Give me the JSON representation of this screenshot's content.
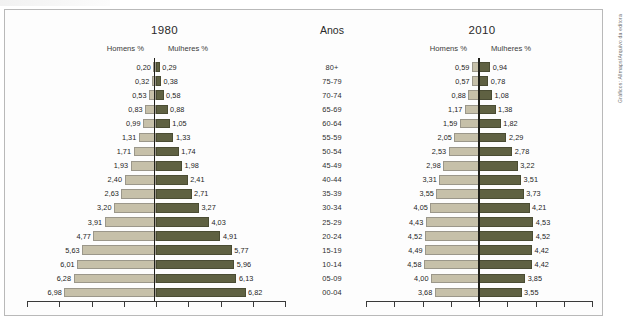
{
  "credit": "Gráficos: Allmaps/Arquivo da editora",
  "years_header": "Anos",
  "age_groups": [
    "80+",
    "75-79",
    "70-74",
    "65-69",
    "60-64",
    "55-59",
    "50-54",
    "45-49",
    "40-44",
    "35-39",
    "30-34",
    "25-29",
    "20-24",
    "15-19",
    "10-14",
    "05-09",
    "00-04"
  ],
  "panels": {
    "left": {
      "title": "1980",
      "men_label": "Homens %",
      "women_label": "Mulheres %"
    },
    "right": {
      "title": "2010",
      "men_label": "Homens %",
      "women_label": "Mulheres %"
    }
  },
  "colors": {
    "men_bar": "#c6c0a9",
    "women_bar": "#5f6142",
    "spine": "#20201a",
    "frame": "#b9b9b9"
  },
  "chart_data": [
    {
      "type": "bar",
      "title": "1980",
      "subtype": "population-pyramid",
      "categories": [
        "80+",
        "75-79",
        "70-74",
        "65-69",
        "60-64",
        "55-59",
        "50-54",
        "45-49",
        "40-44",
        "35-39",
        "30-34",
        "25-29",
        "20-24",
        "15-19",
        "10-14",
        "05-09",
        "00-04"
      ],
      "xlabel": "",
      "ylabel": "Anos",
      "xlim": [
        0,
        8
      ],
      "grid": false,
      "legend": [
        "Homens %",
        "Mulheres %"
      ],
      "series": [
        {
          "name": "Homens %",
          "values": [
            0.2,
            0.32,
            0.53,
            0.83,
            0.99,
            1.31,
            1.71,
            1.93,
            2.4,
            2.63,
            3.2,
            3.91,
            4.77,
            5.63,
            6.01,
            6.28,
            6.98
          ]
        },
        {
          "name": "Mulheres %",
          "values": [
            0.29,
            0.38,
            0.58,
            0.88,
            1.05,
            1.33,
            1.74,
            1.98,
            2.41,
            2.71,
            3.27,
            4.03,
            4.91,
            5.77,
            5.96,
            6.13,
            6.82
          ]
        }
      ],
      "labels": {
        "Homens %": [
          "0,20",
          "0,32",
          "0,53",
          "0,83",
          "0,99",
          "1,31",
          "1,71",
          "1,93",
          "2,40",
          "2,63",
          "3,20",
          "3,91",
          "4,77",
          "5,63",
          "6,01",
          "6,28",
          "6,98"
        ],
        "Mulheres %": [
          "0,29",
          "0,38",
          "0,58",
          "0,88",
          "1,05",
          "1,33",
          "1,74",
          "1,98",
          "2,41",
          "2,71",
          "3,27",
          "4,03",
          "4,91",
          "5,77",
          "5,96",
          "6,13",
          "6,82"
        ]
      }
    },
    {
      "type": "bar",
      "title": "2010",
      "subtype": "population-pyramid",
      "categories": [
        "80+",
        "75-79",
        "70-74",
        "65-69",
        "60-64",
        "55-59",
        "50-54",
        "45-49",
        "40-44",
        "35-39",
        "30-34",
        "25-29",
        "20-24",
        "15-19",
        "10-14",
        "05-09",
        "00-04"
      ],
      "xlabel": "",
      "ylabel": "Anos",
      "xlim": [
        0,
        8
      ],
      "grid": false,
      "legend": [
        "Homens %",
        "Mulheres %"
      ],
      "series": [
        {
          "name": "Homens %",
          "values": [
            0.59,
            0.57,
            0.88,
            1.17,
            1.59,
            2.05,
            2.53,
            2.98,
            3.31,
            3.55,
            4.05,
            4.43,
            4.52,
            4.49,
            4.58,
            4.0,
            3.68
          ]
        },
        {
          "name": "Mulheres %",
          "values": [
            0.94,
            0.78,
            1.08,
            1.38,
            1.82,
            2.29,
            2.78,
            3.22,
            3.51,
            3.73,
            4.21,
            4.53,
            4.52,
            4.42,
            4.42,
            3.85,
            3.55
          ]
        }
      ],
      "labels": {
        "Homens %": [
          "0,59",
          "0,57",
          "0,88",
          "1,17",
          "1,59",
          "2,05",
          "2,53",
          "2,98",
          "3,31",
          "3,55",
          "4,05",
          "4,43",
          "4,52",
          "4,49",
          "4,58",
          "4,00",
          "3,68"
        ],
        "Mulheres %": [
          "0,94",
          "0,78",
          "1,08",
          "1,38",
          "1,82",
          "2,29",
          "2,78",
          "3,22",
          "3,51",
          "3,73",
          "4,21",
          "4,53",
          "4,52",
          "4,42",
          "4,42",
          "3,85",
          "3,55"
        ]
      }
    }
  ]
}
